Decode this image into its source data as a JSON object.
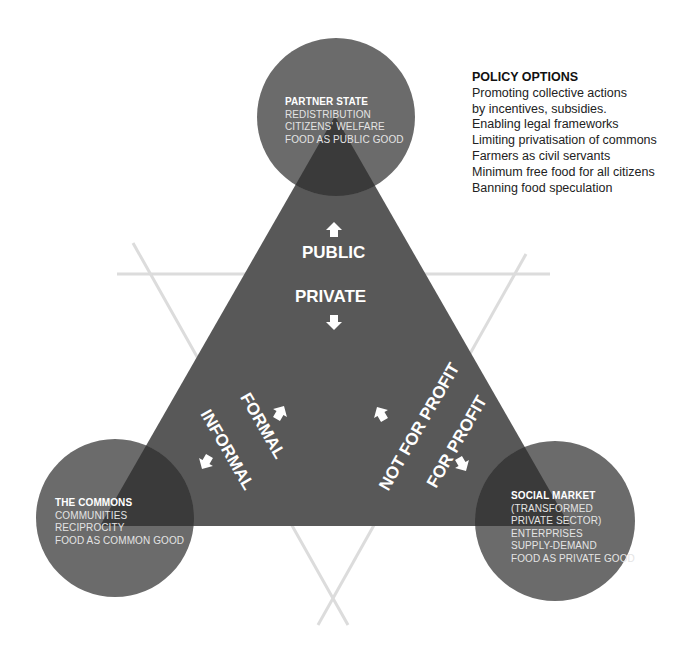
{
  "policy_options": {
    "title": "POLICY OPTIONS",
    "items": [
      "Promoting collective actions",
      "by incentives, subsidies.",
      "Enabling legal frameworks",
      "Limiting privatisation of commons",
      "Farmers as civil servants",
      "Minimum free food for all citizens",
      "Banning food speculation"
    ]
  },
  "nodes": {
    "partner_state": {
      "title": "PARTNER STATE",
      "lines": [
        "REDISTRIBUTION",
        "CITIZENS' WELFARE",
        "FOOD AS PUBLIC GOOD"
      ]
    },
    "the_commons": {
      "title": "THE COMMONS",
      "lines": [
        "COMMUNITIES",
        "RECIPROCITY",
        "FOOD AS COMMON GOOD"
      ]
    },
    "social_market": {
      "title": "SOCIAL MARKET",
      "lines": [
        "(TRANSFORMED",
        "PRIVATE SECTOR)",
        "ENTERPRISES",
        "SUPPLY-DEMAND",
        "FOOD AS PRIVATE GOOD"
      ]
    }
  },
  "axes": {
    "public": "PUBLIC",
    "private": "PRIVATE",
    "formal": "FORMAL",
    "informal": "INFORMAL",
    "not_for_profit": "NOT FOR PROFIT",
    "for_profit": "FOR PROFIT"
  },
  "colors": {
    "triangle": "#585858",
    "circle": "#6b6b6b",
    "overlap": "#3a3a3a",
    "guide_lines": "#dcdcdc",
    "label_text": "#ffffff"
  }
}
